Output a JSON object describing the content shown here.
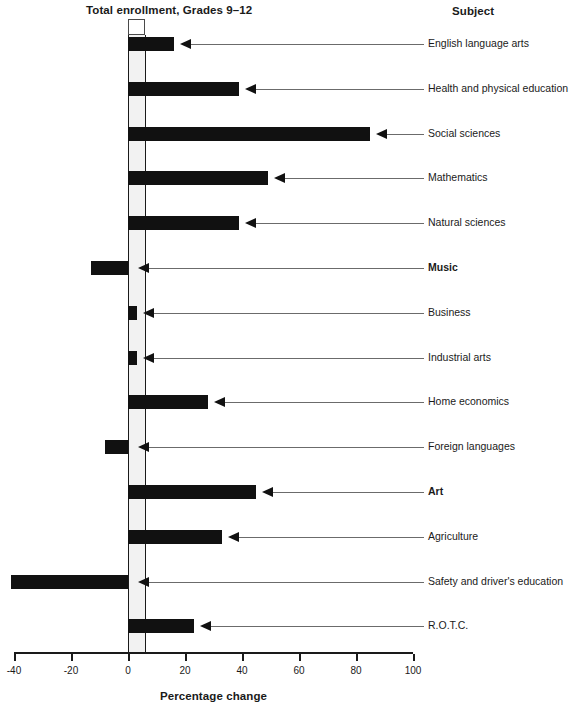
{
  "chart_data": {
    "type": "bar",
    "orientation": "horizontal",
    "title": "Total enrollment, Grades 9–12",
    "subtitle": "",
    "xlabel": "Percentage change",
    "ylabel": "Subject",
    "xlim": [
      -40,
      100
    ],
    "xticks": [
      -40,
      -20,
      0,
      20,
      40,
      60,
      80,
      100
    ],
    "xticklabels": [
      "-40",
      "-20",
      "0",
      "20",
      "40",
      "60",
      "80",
      "100"
    ],
    "grid": false,
    "legend": "none",
    "reference_band": {
      "label": "Total enrollment, Grades 9–12",
      "from": 0,
      "to": 6,
      "color": "#f2f2f2"
    },
    "reference_lines": [
      {
        "name": "zero-line",
        "value": 0
      },
      {
        "name": "total-enrollment-line",
        "value": 6
      }
    ],
    "categories": [
      "English language arts",
      "Health and physical education",
      "Social sciences",
      "Mathematics",
      "Natural sciences",
      "Music",
      "Business",
      "Industrial arts",
      "Home economics",
      "Foreign languages",
      "Art",
      "Agriculture",
      "Safety and driver's education",
      "R.O.T.C."
    ],
    "values": [
      16,
      39,
      85,
      49,
      39,
      -13,
      3,
      3,
      28,
      -8,
      45,
      33,
      -41,
      23
    ],
    "emphasized_categories": [
      "Music",
      "Art"
    ],
    "bar_color": "#111111"
  },
  "header": {
    "enrollment_title": "Total enrollment, Grades 9–12",
    "subject_heading": "Subject"
  },
  "axis": {
    "title": "Percentage change",
    "ticks": [
      "-40",
      "-20",
      "0",
      "20",
      "40",
      "60",
      "80",
      "100"
    ]
  }
}
